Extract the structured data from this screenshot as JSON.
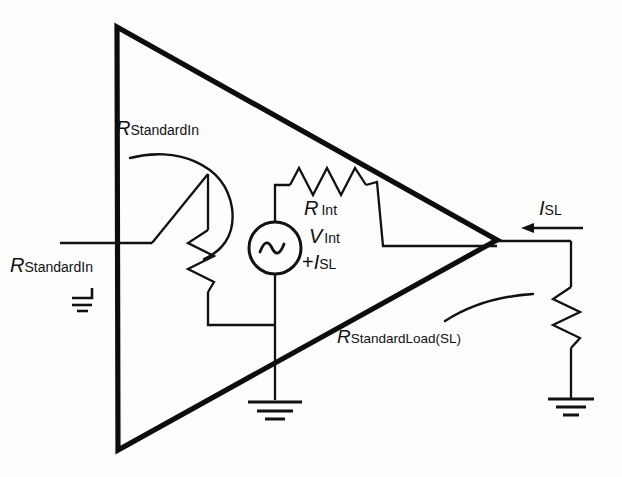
{
  "diagram": {
    "type": "circuit-schematic",
    "background_color": "#fdfdfd",
    "line_color": "#111111"
  },
  "labels": {
    "r_standard_in_inner": {
      "symbol": "R",
      "subscript": "StandardIn",
      "full": "R_StandardIn"
    },
    "r_standard_in_outer": {
      "symbol": "R",
      "subscript": "StandardIn",
      "full": "R_StandardIn"
    },
    "r_int": {
      "symbol": "R",
      "subscript": "Int",
      "full": "R_Int"
    },
    "v_int": {
      "symbol": "V",
      "subscript": "Int",
      "full": "V_Int"
    },
    "plus_i_sl": {
      "prefix": "+",
      "symbol": "I",
      "subscript": "SL",
      "full": "+I_SL"
    },
    "i_sl": {
      "symbol": "I",
      "subscript": "SL",
      "full": "I_SL"
    },
    "r_standard_load": {
      "symbol": "R",
      "subscript": "StandardLoad(SL)",
      "full": "R_StandardLoad(SL)"
    }
  },
  "components": [
    {
      "name": "amplifier-triangle",
      "kind": "triangle",
      "orientation": "right-pointing"
    },
    {
      "name": "input-resistor",
      "kind": "resistor",
      "orientation": "vertical",
      "label": "R_StandardIn"
    },
    {
      "name": "internal-resistor",
      "kind": "resistor",
      "orientation": "horizontal",
      "label": "R_Int"
    },
    {
      "name": "ac-source",
      "kind": "ac-voltage-source",
      "label": "V_Int +I_SL"
    },
    {
      "name": "load-resistor",
      "kind": "resistor",
      "orientation": "vertical",
      "label": "R_StandardLoad(SL)"
    },
    {
      "name": "source-ground",
      "kind": "ground"
    },
    {
      "name": "load-ground",
      "kind": "ground"
    },
    {
      "name": "input-ground",
      "kind": "ground"
    },
    {
      "name": "output-current-arrow",
      "kind": "current-arrow",
      "direction": "left",
      "label": "I_SL"
    }
  ]
}
